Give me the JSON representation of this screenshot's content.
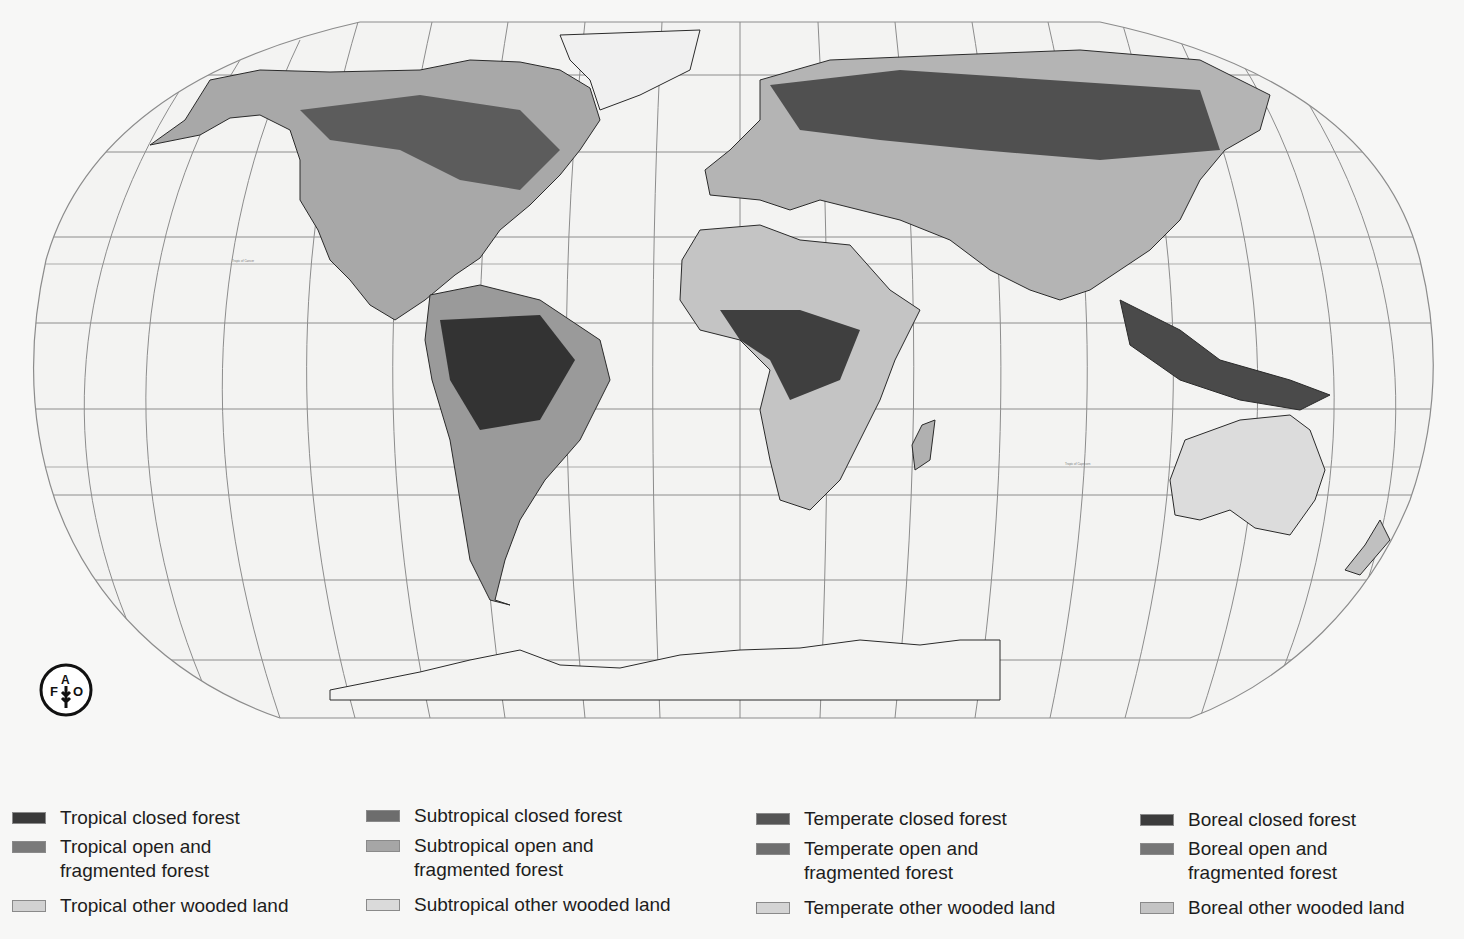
{
  "map": {
    "title": "Global forest ecological zones",
    "projection": "Robinson",
    "graticule_color": "#8c8c8c",
    "ocean_color": "#f3f3f2",
    "coast_color": "#2a2a2a",
    "tropic_labels": {
      "cancer": "Tropic of Cancer",
      "capricorn_africa": "Tropic of Capricorn",
      "capricorn_australia": "Tropic of Capricorn"
    }
  },
  "logo": {
    "name": "FAO",
    "letters": [
      "F",
      "A",
      "O"
    ],
    "motto": "FIAT PANIS"
  },
  "legend": {
    "columns": [
      {
        "zone": "Tropical",
        "items": [
          {
            "label": "Tropical closed forest",
            "color": "#3a3a3a"
          },
          {
            "label_line1": "Tropical open and",
            "label_line2": "fragmented forest",
            "color": "#7a7a7a"
          },
          {
            "label": "Tropical other wooded land",
            "color": "#d2d2d2"
          }
        ]
      },
      {
        "zone": "Subtropical",
        "items": [
          {
            "label": "Subtropical closed forest",
            "color": "#6d6d6d"
          },
          {
            "label_line1": "Subtropical open and",
            "label_line2": "fragmented forest",
            "color": "#a6a6a6"
          },
          {
            "label": "Subtropical other wooded land",
            "color": "#dadada"
          }
        ]
      },
      {
        "zone": "Temperate",
        "items": [
          {
            "label": "Temperate closed forest",
            "color": "#555555"
          },
          {
            "label_line1": "Temperate open and",
            "label_line2": "fragmented forest",
            "color": "#6f6f6f"
          },
          {
            "label": "Temperate other wooded land",
            "color": "#d4d4d4"
          }
        ]
      },
      {
        "zone": "Boreal",
        "items": [
          {
            "label": "Boreal closed forest",
            "color": "#3c3c3c"
          },
          {
            "label_line1": "Boreal open and",
            "label_line2": "fragmented forest",
            "color": "#767676"
          },
          {
            "label": "Boreal other wooded land",
            "color": "#c4c4c4"
          }
        ]
      }
    ]
  }
}
